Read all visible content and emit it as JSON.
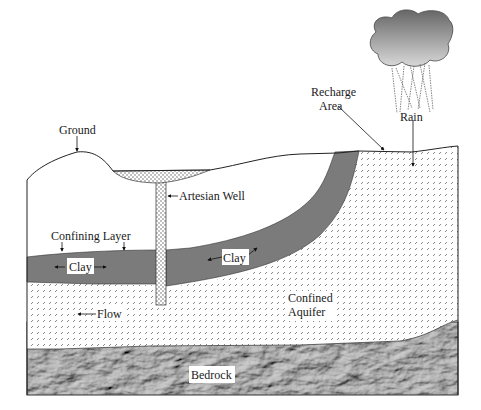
{
  "diagram": {
    "type": "cross-section",
    "labels": {
      "ground": "Ground",
      "artesian_well": "Artesian Well",
      "recharge_area_line1": "Recharge",
      "recharge_area_line2": "Area",
      "rain": "Rain",
      "confining_layer": "Confining Layer",
      "clay_left": "Clay",
      "clay_right": "Clay",
      "flow": "Flow",
      "confined_aquifer_line1": "Confined",
      "confined_aquifer_line2": "Aquifer",
      "bedrock": "Bedrock"
    },
    "layers": [
      {
        "name": "Ground surface",
        "fill": "none"
      },
      {
        "name": "Clay (confining layer)",
        "fill": "#7a7a7a"
      },
      {
        "name": "Confined Aquifer",
        "fill": "dotted-hatch"
      },
      {
        "name": "Bedrock",
        "fill": "rock-texture"
      }
    ],
    "colors": {
      "clay": "#7b7b7b",
      "bedrock": "#8a8a8a",
      "cloud_top": "#6e6e6e",
      "cloud_bottom": "#d4d4d4",
      "line": "#1a1a1a"
    }
  }
}
